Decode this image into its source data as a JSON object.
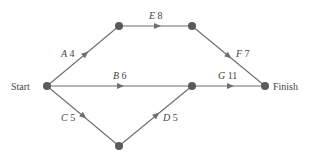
{
  "diagram": {
    "type": "activity-on-arc network",
    "nodes": [
      {
        "id": "start",
        "label": "Start",
        "x": 47,
        "y": 86
      },
      {
        "id": "n1",
        "label": "",
        "x": 119,
        "y": 26
      },
      {
        "id": "n2",
        "label": "",
        "x": 192,
        "y": 26
      },
      {
        "id": "n3",
        "label": "",
        "x": 192,
        "y": 86
      },
      {
        "id": "n4",
        "label": "",
        "x": 119,
        "y": 146
      },
      {
        "id": "finish",
        "label": "Finish",
        "x": 265,
        "y": 86
      }
    ],
    "edges": [
      {
        "activity": "A",
        "duration": "4",
        "from": "start",
        "to": "n1"
      },
      {
        "activity": "E",
        "duration": "8",
        "from": "n1",
        "to": "n2"
      },
      {
        "activity": "F",
        "duration": "7",
        "from": "n2",
        "to": "finish"
      },
      {
        "activity": "B",
        "duration": "6",
        "from": "start",
        "to": "n3"
      },
      {
        "activity": "G",
        "duration": "11",
        "from": "n3",
        "to": "finish"
      },
      {
        "activity": "C",
        "duration": "5",
        "from": "start",
        "to": "n4"
      },
      {
        "activity": "D",
        "duration": "5",
        "from": "n4",
        "to": "n3"
      }
    ],
    "labels": {
      "start": "Start",
      "finish": "Finish",
      "A": "A",
      "A_dur": "4",
      "B": "B",
      "B_dur": "6",
      "C": "C",
      "C_dur": "5",
      "D": "D",
      "D_dur": "5",
      "E": "E",
      "E_dur": "8",
      "F": "F",
      "F_dur": "7",
      "G": "G",
      "G_dur": "11"
    }
  }
}
